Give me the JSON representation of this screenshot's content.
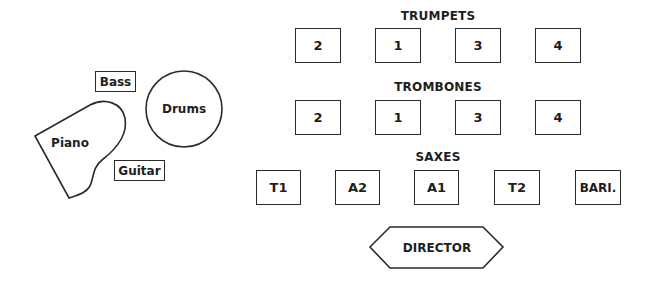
{
  "diagram": {
    "rhythm_section": {
      "piano": "Piano",
      "bass": "Bass",
      "drums": "Drums",
      "guitar": "Guitar"
    },
    "sections": [
      {
        "label": "TRUMPETS",
        "seats": [
          "2",
          "1",
          "3",
          "4"
        ]
      },
      {
        "label": "TROMBONES",
        "seats": [
          "2",
          "1",
          "3",
          "4"
        ]
      },
      {
        "label": "SAXES",
        "seats": [
          "T1",
          "A2",
          "A1",
          "T2",
          "BARI."
        ]
      }
    ],
    "director": "DIRECTOR",
    "colors": {
      "stroke": "#2a2a2a",
      "text": "#1e1e1e",
      "background": "#ffffff"
    }
  }
}
